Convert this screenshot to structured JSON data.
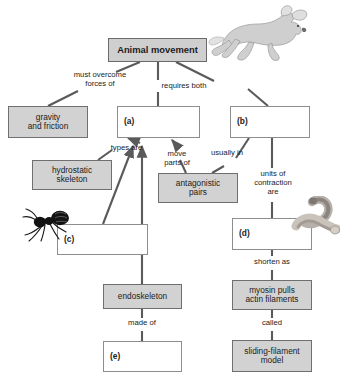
{
  "diagram": {
    "kind": "concept-map",
    "nodes": [
      {
        "id": "animal-movement",
        "label": "Animal movement",
        "style": "title",
        "x": 108,
        "y": 38,
        "w": 99,
        "h": 24
      },
      {
        "id": "gravity-friction",
        "label": "gravity\nand friction",
        "style": "shaded",
        "x": 8,
        "y": 106,
        "w": 80,
        "h": 32
      },
      {
        "id": "blank-a",
        "label": "(a)",
        "style": "blank",
        "x": 117,
        "y": 106,
        "w": 83,
        "h": 32
      },
      {
        "id": "blank-b",
        "label": "(b)",
        "style": "blank",
        "x": 230,
        "y": 106,
        "w": 80,
        "h": 32
      },
      {
        "id": "hydrostatic-skeleton",
        "label": "hydrostatic\nskeleton",
        "style": "shaded",
        "x": 32,
        "y": 160,
        "w": 80,
        "h": 30
      },
      {
        "id": "antagonistic-pairs",
        "label": "antagonistic\npairs",
        "style": "shaded",
        "x": 158,
        "y": 173,
        "w": 80,
        "h": 30
      },
      {
        "id": "blank-c",
        "label": "(c)",
        "style": "blank",
        "x": 57,
        "y": 224,
        "w": 91,
        "h": 31
      },
      {
        "id": "blank-d",
        "label": "(d)",
        "style": "blank",
        "x": 232,
        "y": 218,
        "w": 80,
        "h": 32
      },
      {
        "id": "endoskeleton",
        "label": "endoskeleton",
        "style": "shaded",
        "x": 103,
        "y": 284,
        "w": 79,
        "h": 25
      },
      {
        "id": "myosin-pulls-actin",
        "label": "myosin pulls\nactin filaments",
        "style": "shaded",
        "x": 232,
        "y": 280,
        "w": 80,
        "h": 30
      },
      {
        "id": "blank-e",
        "label": "(e)",
        "style": "blank",
        "x": 103,
        "y": 341,
        "w": 79,
        "h": 31
      },
      {
        "id": "sliding-filament-model",
        "label": "sliding-filament\nmodel",
        "style": "shaded",
        "x": 232,
        "y": 340,
        "w": 80,
        "h": 32
      }
    ],
    "edge_labels": [
      {
        "id": "must-overcome-forces-of",
        "text": "must overcome\nforces of",
        "x": 62,
        "y": 71,
        "w": 76
      },
      {
        "id": "requires-both",
        "text": "requires both",
        "x": 153,
        "y": 82,
        "w": 62
      },
      {
        "id": "types-are",
        "text": "types are",
        "x": 104,
        "y": 144,
        "w": 45
      },
      {
        "id": "move-parts-of",
        "text": "move\nparts of",
        "x": 157,
        "y": 150,
        "w": 40
      },
      {
        "id": "usually-in",
        "text": "usually in",
        "x": 205,
        "y": 149,
        "w": 44
      },
      {
        "id": "units-of-contraction-are",
        "text": "units of\ncontraction\nare",
        "x": 248,
        "y": 170,
        "w": 50
      },
      {
        "id": "shorten-as",
        "text": "shorten as",
        "x": 247,
        "y": 258,
        "w": 50
      },
      {
        "id": "called",
        "text": "called",
        "x": 256,
        "y": 320,
        "w": 32
      },
      {
        "id": "made-of",
        "text": "made of",
        "x": 123,
        "y": 320,
        "w": 40
      }
    ],
    "images": [
      {
        "id": "horse-photo",
        "alt": "galloping white horse"
      },
      {
        "id": "ant-photo",
        "alt": "black ant"
      },
      {
        "id": "muscle-photo",
        "alt": "muscle bundle"
      }
    ]
  }
}
